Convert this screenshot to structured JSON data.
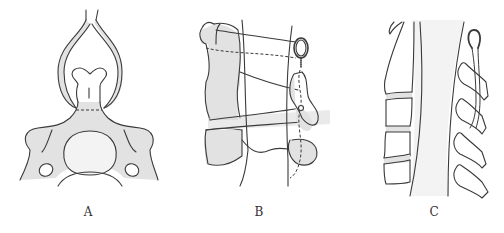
{
  "figure": {
    "panels": [
      {
        "id": "A",
        "label": "A",
        "description": "Axial view of vertebra with posterior element / spinous process enclosed by a loop (dashed osteotomy line at base)"
      },
      {
        "id": "B",
        "label": "B",
        "description": "Posterior-oblique view of vertebral column with wire loop and wire fixation passing along spinous processes"
      },
      {
        "id": "C",
        "label": "C",
        "description": "Sagittal view of spine showing vertebral bodies, discs, spinal canal and spinous processes with twisted wire loop"
      }
    ]
  },
  "colors": {
    "ink": "#3a3a3a",
    "shade": "#e2e2e2",
    "background": "#ffffff"
  }
}
